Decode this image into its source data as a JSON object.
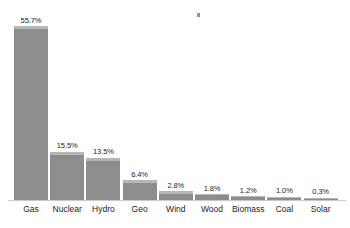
{
  "chart_data": {
    "type": "bar",
    "title": "",
    "subtitle": "",
    "xlabel": "",
    "ylabel": "",
    "ylim": [
      0,
      58
    ],
    "grid": false,
    "legend": "none",
    "unit": "%",
    "categories": [
      "Gas",
      "Nuclear",
      "Hydro",
      "Geo",
      "Wind",
      "Wood",
      "Biomass",
      "Coal",
      "Solar"
    ],
    "values": [
      55.7,
      15.5,
      13.5,
      6.4,
      2.8,
      1.8,
      1.2,
      1.0,
      0.3
    ],
    "value_labels": [
      "55.7%",
      "15.5%",
      "13.5%",
      "6.4%",
      "2.8%",
      "1.8%",
      "1.2%",
      "1.0%",
      "0.3%"
    ],
    "bars": [
      {
        "category": "Gas",
        "value": 55.7,
        "label": "55.7%"
      },
      {
        "category": "Nuclear",
        "value": 15.5,
        "label": "15.5%"
      },
      {
        "category": "Hydro",
        "value": 13.5,
        "label": "13.5%"
      },
      {
        "category": "Geo",
        "value": 6.4,
        "label": "6.4%"
      },
      {
        "category": "Wind",
        "value": 2.8,
        "label": "2.8%"
      },
      {
        "category": "Wood",
        "value": 1.8,
        "label": "1.8%"
      },
      {
        "category": "Biomass",
        "value": 1.2,
        "label": "1.2%"
      },
      {
        "category": "Coal",
        "value": 1.0,
        "label": "1.0%"
      },
      {
        "category": "Solar",
        "value": 0.3,
        "label": "0.3%"
      }
    ]
  },
  "style": {
    "background": "#ffffff",
    "bar_fill": "#8d8d8d",
    "bar_highlight": "#b6b6b6",
    "axis_line": "#c9c9c9",
    "text": "#1d1d1d"
  }
}
